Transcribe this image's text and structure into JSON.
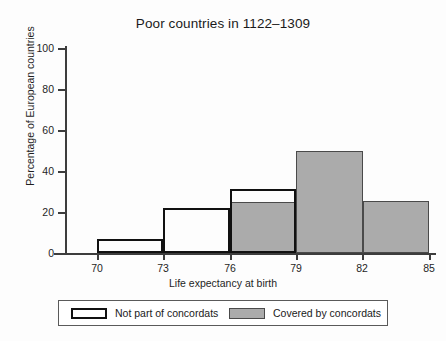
{
  "chart_data": {
    "type": "bar",
    "title": "Poor countries in 1122–1309",
    "xlabel": "Life expectancy at birth",
    "ylabel": "Percentage of European countries",
    "xlim": [
      68.5,
      85.8
    ],
    "ylim": [
      0,
      100
    ],
    "grid": false,
    "legend_position": "below-axes",
    "xticks": [
      "70",
      "73",
      "76",
      "79",
      "82",
      "85"
    ],
    "xtick_values": [
      70,
      73,
      76,
      79,
      82,
      85
    ],
    "yticks": [
      "0",
      "20",
      "40",
      "60",
      "80",
      "100"
    ],
    "ytick_values": [
      0,
      20,
      40,
      60,
      80,
      100
    ],
    "bin_edges": [
      70,
      73,
      76,
      79,
      82,
      85
    ],
    "bins": [
      "70–73",
      "73–76",
      "76–79",
      "79–82",
      "82–85"
    ],
    "series": [
      {
        "name": "Not part of concordats",
        "style": "outline",
        "color": "#ffffff",
        "edge_color": "#111111",
        "bins": [
          "70–73",
          "73–76",
          "76–79"
        ],
        "values": [
          7,
          22,
          31
        ]
      },
      {
        "name": "Covered by concordats",
        "style": "filled",
        "color": "#ababab",
        "edge_color": "#4a4a4a",
        "bins": [
          "76–79",
          "79–82",
          "82–85"
        ],
        "values": [
          25,
          50,
          25.5
        ]
      }
    ]
  },
  "chart": {
    "title": "Poor countries in 1122–1309",
    "xlabel": "Life expectancy at birth",
    "ylabel": "Percentage of European countries",
    "ytick_0": "0",
    "ytick_20": "20",
    "ytick_40": "40",
    "ytick_60": "60",
    "ytick_80": "80",
    "ytick_100": "100",
    "xtick_70": "70",
    "xtick_73": "73",
    "xtick_76": "76",
    "xtick_79": "79",
    "xtick_82": "82",
    "xtick_85": "85"
  },
  "legend": {
    "items": [
      {
        "label": "Not part of concordats",
        "swatch": "white-outlined-rect"
      },
      {
        "label": "Covered by concordats",
        "swatch": "gray-filled-rect"
      }
    ]
  },
  "colors": {
    "bar_fill_gray": "#ababab",
    "bar_edge_dark": "#4a4a4a",
    "outline_black": "#111111",
    "axis": "#3d3d3d",
    "text": "#1a1a1a",
    "background": "#ffffff"
  }
}
